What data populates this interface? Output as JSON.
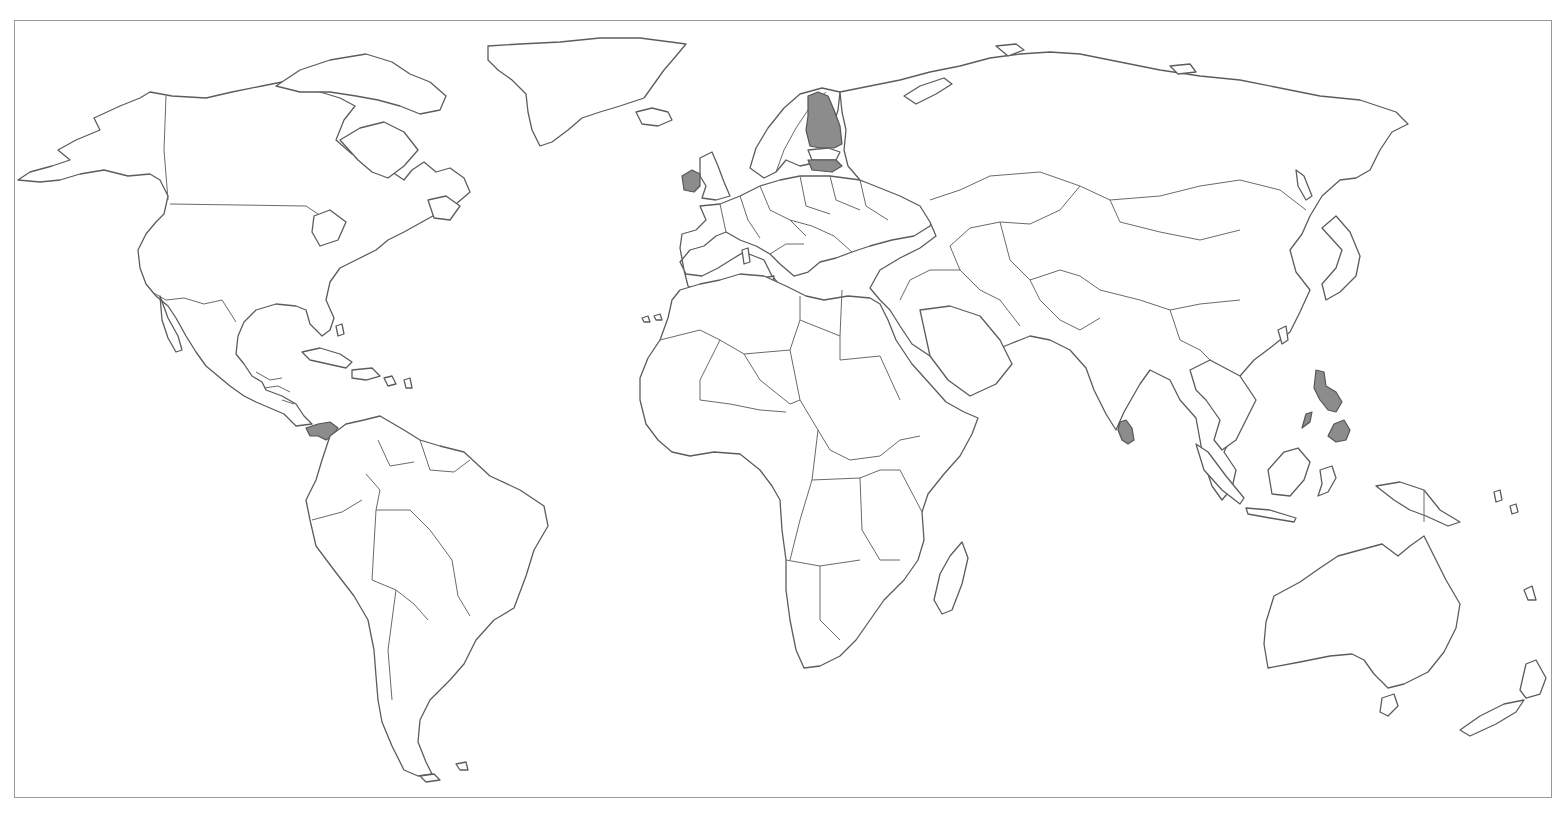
{
  "map": {
    "type": "blank political world map",
    "projection": "equirectangular-style",
    "labels_visible": false,
    "colors": {
      "background": "#ffffff",
      "land_fill": "#ffffff",
      "outline": "#5c5c5c",
      "frame": "#9a9a9a",
      "highlight_fill": "#8c8c8c"
    },
    "highlighted_countries": [
      {
        "id": "panama",
        "name": "Panama",
        "region": "Central America"
      },
      {
        "id": "ireland",
        "name": "Ireland",
        "region": "Europe"
      },
      {
        "id": "finland",
        "name": "Finland",
        "region": "Europe"
      },
      {
        "id": "latvia",
        "name": "Latvia",
        "region": "Europe"
      },
      {
        "id": "sri-lanka",
        "name": "Sri Lanka",
        "region": "South Asia"
      },
      {
        "id": "philippines",
        "name": "Philippines",
        "region": "Southeast Asia"
      }
    ],
    "continents": [
      "North America",
      "Greenland",
      "South America",
      "Europe",
      "Africa",
      "Asia",
      "Australia",
      "New Zealand"
    ]
  }
}
